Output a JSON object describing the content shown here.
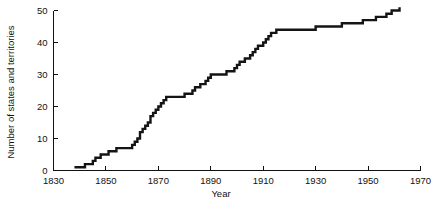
{
  "figure": {
    "background_color": "#ffffff",
    "line_color": "#141414",
    "axis_color": "#111111"
  },
  "chart_data": {
    "type": "line",
    "title": "",
    "subtitle": "",
    "xlabel": "Year",
    "ylabel": "Number of states and territories",
    "xlim": [
      1830,
      1970
    ],
    "ylim": [
      0,
      50
    ],
    "x_ticks": [
      1830,
      1850,
      1870,
      1890,
      1910,
      1930,
      1950,
      1970
    ],
    "x_tick_labels": [
      "1830",
      "1850",
      "1870",
      "1890",
      "1910",
      "1930",
      "1950",
      "1970"
    ],
    "y_ticks": [
      0,
      10,
      20,
      30,
      40,
      50
    ],
    "y_tick_labels": [
      "0",
      "10",
      "20",
      "30",
      "40",
      "50"
    ],
    "grid": false,
    "legend": false,
    "legend_position": "none",
    "drawstyle": "steps-post",
    "annotations": [],
    "series": [
      {
        "name": "Number of states and territories",
        "color": "#141414",
        "x": [
          1838,
          1840,
          1842,
          1844,
          1845,
          1846,
          1847,
          1848,
          1849,
          1850,
          1851,
          1853,
          1854,
          1857,
          1858,
          1859,
          1860,
          1861,
          1862,
          1863,
          1864,
          1865,
          1866,
          1867,
          1868,
          1869,
          1870,
          1871,
          1872,
          1873,
          1874,
          1875,
          1876,
          1877,
          1878,
          1879,
          1880,
          1881,
          1883,
          1884,
          1885,
          1886,
          1887,
          1888,
          1889,
          1890,
          1891,
          1893,
          1894,
          1896,
          1897,
          1899,
          1900,
          1901,
          1903,
          1905,
          1906,
          1907,
          1908,
          1910,
          1911,
          1912,
          1913,
          1915,
          1917,
          1919,
          1921,
          1925,
          1930,
          1935,
          1940,
          1945,
          1948,
          1950,
          1953,
          1955,
          1957,
          1959,
          1960,
          1962
        ],
        "y": [
          1,
          1,
          2,
          2,
          3,
          4,
          4,
          5,
          5,
          5,
          6,
          6,
          7,
          7,
          7,
          7,
          8,
          9,
          10,
          12,
          13,
          14,
          15,
          17,
          18,
          19,
          20,
          21,
          22,
          23,
          23,
          23,
          23,
          23,
          23,
          23,
          24,
          24,
          25,
          26,
          26,
          27,
          27,
          28,
          29,
          30,
          30,
          30,
          30,
          31,
          31,
          32,
          33,
          34,
          35,
          36,
          37,
          38,
          39,
          40,
          41,
          42,
          43,
          44,
          44,
          44,
          44,
          44,
          45,
          45,
          46,
          46,
          47,
          47,
          48,
          48,
          49,
          50,
          50,
          51
        ],
        "y_start": 1,
        "y_end": 51,
        "x_start": 1838,
        "x_end": 1962
      }
    ]
  }
}
